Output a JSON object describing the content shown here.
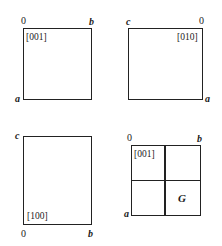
{
  "panels": [
    {
      "id": "panel-001",
      "direction": "[001]",
      "corners": {
        "top_left": "0",
        "top_right": "b",
        "bottom_left": "a"
      }
    },
    {
      "id": "panel-010",
      "direction": "[010]",
      "corners": {
        "top_left": "c",
        "top_right": "0",
        "bottom_right": "a"
      }
    },
    {
      "id": "panel-100",
      "direction": "[100]",
      "corners": {
        "top_left": "c",
        "bottom_left": "0",
        "bottom_right": "b"
      }
    },
    {
      "id": "panel-001-grid",
      "direction": "[001]",
      "corners": {
        "top_left": "0",
        "top_right": "b",
        "bottom_left": "a"
      },
      "cell_label": "G"
    }
  ]
}
